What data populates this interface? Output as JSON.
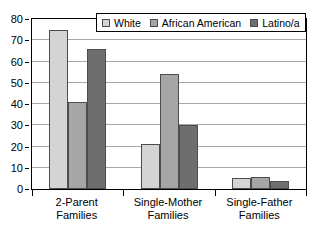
{
  "chart_data": {
    "type": "bar",
    "title": "",
    "xlabel": "",
    "ylabel": "",
    "categories": [
      "2-Parent Families",
      "Single-Mother Families",
      "Single-Father Families"
    ],
    "category_lines": [
      [
        "2-Parent",
        "Families"
      ],
      [
        "Single-Mother",
        "Families"
      ],
      [
        "Single-Father",
        "Families"
      ]
    ],
    "series": [
      {
        "name": "White",
        "color": "#d4d4d4",
        "values": [
          75,
          21,
          5
        ]
      },
      {
        "name": "African American",
        "color": "#a6a6a6",
        "values": [
          41,
          54,
          5.5
        ]
      },
      {
        "name": "Latino/a",
        "color": "#6e6e6e",
        "values": [
          66,
          30,
          4
        ]
      }
    ],
    "ylim": [
      0,
      80
    ],
    "yticks": [
      0,
      10,
      20,
      30,
      40,
      50,
      60,
      70,
      80
    ],
    "ytick_labels": [
      "0",
      "10",
      "20",
      "30",
      "40",
      "50",
      "60",
      "70",
      "80"
    ],
    "grid": true,
    "grid_axis": "y",
    "legend_position": "top-center",
    "bar_border_color": "#4d4d4d",
    "axis_color": "#000000",
    "grid_color": "#a8a8a8",
    "background": "#ffffff"
  },
  "legend": {
    "items": [
      {
        "label": "White",
        "color": "#d4d4d4"
      },
      {
        "label": "African American",
        "color": "#a6a6a6"
      },
      {
        "label": "Latino/a",
        "color": "#6e6e6e"
      }
    ]
  }
}
